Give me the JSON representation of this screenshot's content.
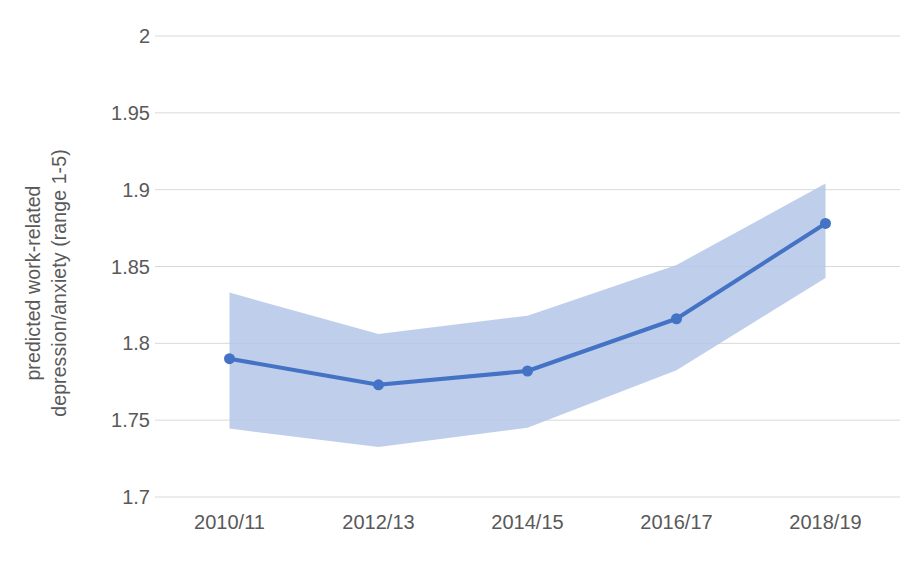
{
  "chart_data": {
    "type": "line",
    "title": "",
    "subtitle": "",
    "xlabel": "",
    "ylabel": "predicted work-related depression/anxiety (range 1-5)",
    "ylabel_lines": [
      "predicted work-related",
      "depression/anxiety (range 1-5)"
    ],
    "categories": [
      "2010/11",
      "2012/13",
      "2014/15",
      "2016/17",
      "2018/19"
    ],
    "values": [
      1.79,
      1.773,
      1.782,
      1.816,
      1.878
    ],
    "series": [
      {
        "name": "predicted work-related depression/anxiety",
        "values": [
          1.79,
          1.773,
          1.782,
          1.816,
          1.878
        ],
        "color": "#4472C4"
      },
      {
        "name": "confidence interval upper",
        "values": [
          1.833,
          1.806,
          1.818,
          1.851,
          1.904
        ],
        "color": "#B4C7E7"
      },
      {
        "name": "confidence interval lower",
        "values": [
          1.7445,
          1.7325,
          1.745,
          1.7825,
          1.8425
        ],
        "color": "#B4C7E7"
      }
    ],
    "confidence_band": {
      "label": "confidence interval",
      "upper": [
        1.833,
        1.806,
        1.818,
        1.851,
        1.904
      ],
      "lower": [
        1.7445,
        1.7325,
        1.745,
        1.7825,
        1.8425
      ],
      "fill_color": "#B4C7E7"
    },
    "ylim": [
      1.7,
      2.0
    ],
    "yticks": [
      1.7,
      1.75,
      1.8,
      1.85,
      1.9,
      1.95,
      2.0
    ],
    "ytick_labels": [
      "1.7",
      "1.75",
      "1.8",
      "1.85",
      "1.9",
      "1.95",
      "2"
    ],
    "xtick_labels": [
      "2010/11",
      "2012/13",
      "2014/15",
      "2016/17",
      "2018/19"
    ],
    "grid": true,
    "grid_axis": "y",
    "grid_color": "#D9D9D9",
    "legend": false,
    "legend_position": "none",
    "marker": "circle",
    "line_color": "#4472C4",
    "line_width": 4,
    "marker_size": 11,
    "background_color": "#FFFFFF",
    "text_color": "#595959",
    "annotations": []
  }
}
